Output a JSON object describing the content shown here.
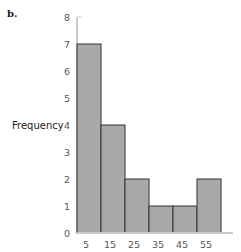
{
  "panel_label": "b.",
  "chart_data": {
    "type": "bar",
    "title": "",
    "xlabel": "",
    "ylabel": "Frequency",
    "categories": [
      "5",
      "15",
      "25",
      "35",
      "45",
      "55"
    ],
    "bin_centers": [
      5,
      15,
      25,
      35,
      45,
      55
    ],
    "bin_width": 10,
    "values": [
      7,
      4,
      2,
      1,
      1,
      2
    ],
    "ylim": [
      0,
      8
    ],
    "yticks": [
      0,
      1,
      2,
      3,
      4,
      5,
      6,
      7,
      8
    ],
    "grid": false,
    "legend": null,
    "colors": {
      "bar_fill": "#a9a9a9",
      "bar_edge": "#333333",
      "axis": "#cccccc"
    }
  }
}
